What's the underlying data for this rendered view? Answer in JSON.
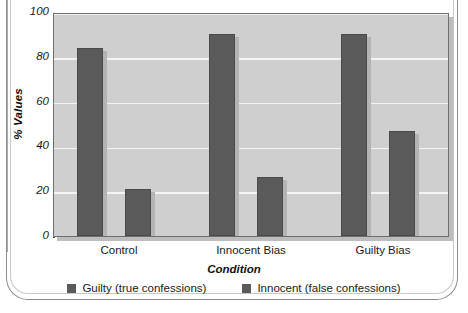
{
  "chart_data": {
    "type": "bar",
    "title": "",
    "subtitle": "",
    "xlabel": "Condition",
    "ylabel": "% Values",
    "categories": [
      "Control",
      "Innocent Bias",
      "Guilty Bias"
    ],
    "series": [
      {
        "name": "Guilty (true confessions)",
        "color": "#5a5a5a",
        "values": [
          84,
          90,
          90
        ]
      },
      {
        "name": "Innocent (false confessions)",
        "color": "#5a5a5a",
        "values": [
          21,
          26.5,
          47
        ]
      }
    ],
    "ylim": [
      0,
      100
    ],
    "yticks": [
      0,
      20,
      40,
      60,
      80,
      100
    ],
    "ytick_labels": [
      "0",
      "20",
      "40",
      "60",
      "80",
      "100"
    ],
    "grid": true,
    "grid_color": "#f4f4f4",
    "legend_position": "bottom",
    "plot_background": "#cfcfcf",
    "bar_color": "#5a5a5a",
    "annotations": []
  },
  "axes": {
    "y_title": "% Values",
    "x_title": "Condition"
  },
  "legend": {
    "items": [
      {
        "label": "Guilty (true confessions)",
        "color": "#5a5a5a"
      },
      {
        "label": "Innocent (false confessions)",
        "color": "#5a5a5a"
      }
    ]
  }
}
